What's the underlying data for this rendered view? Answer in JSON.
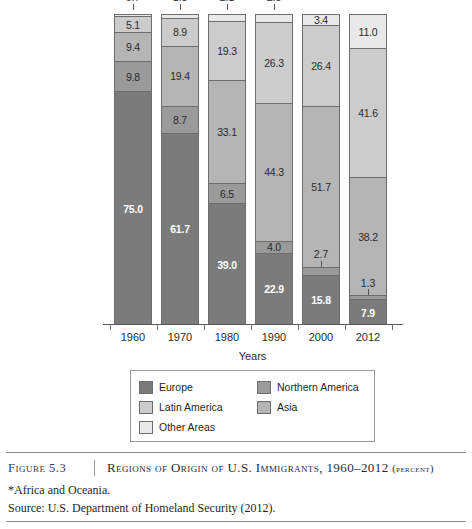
{
  "chart_data": {
    "type": "bar",
    "subtype": "stacked-100-percent",
    "title": "Regions of Origin of U.S. Immigrants, 1960–2012 (Percent)",
    "xlabel": "Years",
    "ylabel": "",
    "ylim": [
      0,
      100
    ],
    "grid": false,
    "legend_position": "bottom",
    "categories": [
      "1960",
      "1970",
      "1980",
      "1990",
      "2000",
      "2012"
    ],
    "series": [
      {
        "name": "Europe",
        "color": "#7b7b7b",
        "values": [
          75.0,
          61.7,
          39.0,
          22.9,
          15.8,
          7.9
        ]
      },
      {
        "name": "Northern America",
        "color": "#9a9a9a",
        "values": [
          9.8,
          8.7,
          6.5,
          4.0,
          2.7,
          1.3
        ]
      },
      {
        "name": "Asia",
        "color": "#b5b5b5",
        "values": [
          9.4,
          19.4,
          33.1,
          44.3,
          51.7,
          38.2
        ]
      },
      {
        "name": "Latin America",
        "color": "#cccccc",
        "values": [
          5.1,
          8.9,
          19.3,
          26.3,
          26.4,
          41.6
        ]
      },
      {
        "name": "Other Areas",
        "color": "#e9e9e9",
        "values": [
          0.7,
          1.3,
          2.1,
          2.5,
          3.4,
          11.0
        ]
      }
    ],
    "annotations": [
      "Tiny 'Other Areas' slices for 1960–2000 are labeled outside the bar with a leader tick.",
      "Thin 'Northern America' bands for 1990, 2000 and 2012 are labeled with a leader tick."
    ]
  },
  "axis": {
    "x_title": "Years",
    "x_categories": [
      "1960",
      "1970",
      "1980",
      "1990",
      "2000",
      "2012"
    ]
  },
  "bars": [
    {
      "year": "1960",
      "top_label": "0.7",
      "top_label_outside": true,
      "segments": [
        {
          "series": "Other Areas",
          "value": 0.7,
          "label": "",
          "label_style": "none"
        },
        {
          "series": "Latin America",
          "value": 5.1,
          "label": "5.1",
          "label_style": "inside-dark"
        },
        {
          "series": "Asia",
          "value": 9.4,
          "label": "9.4",
          "label_style": "inside-dark"
        },
        {
          "series": "Northern America",
          "value": 9.8,
          "label": "9.8",
          "label_style": "inside-dark"
        },
        {
          "series": "Europe",
          "value": 75.0,
          "label": "75.0",
          "label_style": "inside-light"
        }
      ]
    },
    {
      "year": "1970",
      "top_label": "1.3",
      "top_label_outside": true,
      "segments": [
        {
          "series": "Other Areas",
          "value": 1.3,
          "label": "",
          "label_style": "none"
        },
        {
          "series": "Latin America",
          "value": 8.9,
          "label": "8.9",
          "label_style": "inside-dark"
        },
        {
          "series": "Asia",
          "value": 19.4,
          "label": "19.4",
          "label_style": "inside-dark"
        },
        {
          "series": "Northern America",
          "value": 8.7,
          "label": "8.7",
          "label_style": "inside-dark"
        },
        {
          "series": "Europe",
          "value": 61.7,
          "label": "61.7",
          "label_style": "inside-light"
        }
      ]
    },
    {
      "year": "1980",
      "top_label": "2.1",
      "top_label_outside": true,
      "segments": [
        {
          "series": "Other Areas",
          "value": 2.1,
          "label": "",
          "label_style": "none"
        },
        {
          "series": "Latin America",
          "value": 19.3,
          "label": "19.3",
          "label_style": "inside-dark"
        },
        {
          "series": "Asia",
          "value": 33.1,
          "label": "33.1",
          "label_style": "inside-dark"
        },
        {
          "series": "Northern America",
          "value": 6.5,
          "label": "6.5",
          "label_style": "inside-dark"
        },
        {
          "series": "Europe",
          "value": 39.0,
          "label": "39.0",
          "label_style": "inside-light"
        }
      ]
    },
    {
      "year": "1990",
      "top_label": "2.5",
      "top_label_outside": true,
      "segments": [
        {
          "series": "Other Areas",
          "value": 2.5,
          "label": "",
          "label_style": "none"
        },
        {
          "series": "Latin America",
          "value": 26.3,
          "label": "26.3",
          "label_style": "inside-dark"
        },
        {
          "series": "Asia",
          "value": 44.3,
          "label": "44.3",
          "label_style": "inside-dark"
        },
        {
          "series": "Northern America",
          "value": 4.0,
          "label": "4.0",
          "label_style": "inside-dark"
        },
        {
          "series": "Europe",
          "value": 22.9,
          "label": "22.9",
          "label_style": "inside-light"
        }
      ]
    },
    {
      "year": "2000",
      "top_label": "",
      "top_label_outside": false,
      "segments": [
        {
          "series": "Other Areas",
          "value": 3.4,
          "label": "3.4",
          "label_style": "inside-dark"
        },
        {
          "series": "Latin America",
          "value": 26.4,
          "label": "26.4",
          "label_style": "inside-dark"
        },
        {
          "series": "Asia",
          "value": 51.7,
          "label": "51.7",
          "label_style": "inside-dark"
        },
        {
          "series": "Northern America",
          "value": 2.7,
          "label": "2.7",
          "label_style": "callout"
        },
        {
          "series": "Europe",
          "value": 15.8,
          "label": "15.8",
          "label_style": "inside-light"
        }
      ]
    },
    {
      "year": "2012",
      "top_label": "",
      "top_label_outside": false,
      "segments": [
        {
          "series": "Other Areas",
          "value": 11.0,
          "label": "11.0",
          "label_style": "inside-dark"
        },
        {
          "series": "Latin America",
          "value": 41.6,
          "label": "41.6",
          "label_style": "inside-dark"
        },
        {
          "series": "Asia",
          "value": 38.2,
          "label": "38.2",
          "label_style": "inside-dark"
        },
        {
          "series": "Northern America",
          "value": 1.3,
          "label": "1.3",
          "label_style": "callout"
        },
        {
          "series": "Europe",
          "value": 7.9,
          "label": "7.9",
          "label_style": "inside-light"
        }
      ]
    }
  ],
  "legend": {
    "items": [
      {
        "label": "Europe",
        "color": "#7b7b7b"
      },
      {
        "label": "Northern America",
        "color": "#9a9a9a"
      },
      {
        "label": "Latin America",
        "color": "#cccccc"
      },
      {
        "label": "Asia",
        "color": "#b5b5b5"
      },
      {
        "label": "Other Areas",
        "color": "#e9e9e9"
      }
    ]
  },
  "caption": {
    "figure_number": "Figure 5.3",
    "title_main": "Regions of Origin of U.S. Immigrants, 1960–2012 ",
    "title_suffix": "(percent)",
    "footnote": "*Africa and Oceania.",
    "source": "Source: U.S. Department of Homeland Security (2012)."
  }
}
